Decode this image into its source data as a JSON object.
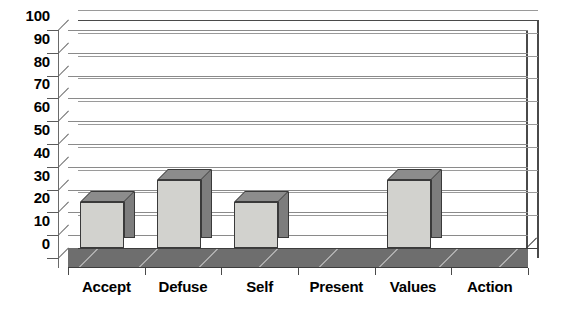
{
  "chart_data": {
    "type": "bar",
    "title": "",
    "subtitle": "",
    "xlabel": "",
    "ylabel": "",
    "categories": [
      "Accept",
      "Defuse",
      "Self",
      "Present",
      "Values",
      "Action"
    ],
    "values": [
      20,
      30,
      20,
      0,
      30,
      0
    ],
    "ylim": [
      0,
      100
    ],
    "ytick_step": 10,
    "yticks": [
      100,
      90,
      80,
      70,
      60,
      50,
      40,
      30,
      20,
      10,
      0
    ],
    "ytick_labels": [
      "100",
      "90",
      "80",
      "70",
      "60",
      "50",
      "40",
      "30",
      "20",
      "10",
      "0"
    ],
    "grid": true,
    "grid_axis": "y",
    "legend": false,
    "legend_position": "none",
    "style": "3d-column",
    "annotations": []
  },
  "colors": {
    "bar_front": "#d2d2ce",
    "bar_side": "#7d7d7d",
    "bar_top": "#8c8c8c",
    "bar_outline": "#3a3a3a",
    "floor": "#6e6e6e",
    "gridline": "#8a8a8a",
    "frame": "#4a4a4a",
    "text": "#000000",
    "background": "#ffffff"
  }
}
